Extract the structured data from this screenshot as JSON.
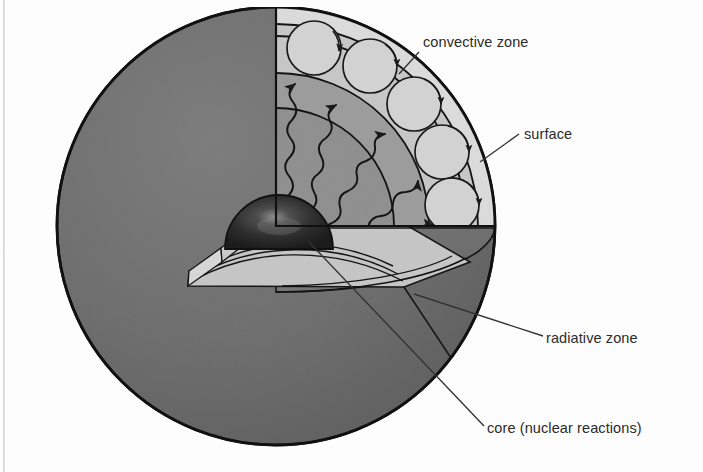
{
  "canvas": {
    "width": 703,
    "height": 472,
    "background": "#fdfdfd"
  },
  "figure": {
    "title_cut_off": "second. The structure of the Sun is",
    "geometry": {
      "sphere_center_x": 276,
      "sphere_center_y": 226,
      "sphere_radius": 219,
      "cut_wedge_angle_deg": 90
    }
  },
  "colors": {
    "outer_sphere": "#6e6e6e",
    "outer_sphere_shadow": "#5f5f5f",
    "surface_band": "#d8d8d8",
    "convective_zone": "#c9c9c9",
    "radiative_zone": "#9a9a9a",
    "radiative_zone_inner": "#8b8b8b",
    "core": "#2a2a2a",
    "core_highlight": "#7a7a7a",
    "floor_light": "#cfcfcf",
    "floor_dark": "#767676",
    "outline": "#1a1a1a",
    "label_text": "#2b2b2b",
    "leader_line": "#3a3a3a",
    "page_background": "#fdfdfd"
  },
  "labels": [
    {
      "id": "convective-zone",
      "text": "convective zone",
      "x": 423,
      "y": 47,
      "anchor": "start",
      "leader": {
        "x1": 419,
        "y1": 52,
        "x2": 399,
        "y2": 74
      }
    },
    {
      "id": "surface",
      "text": "surface",
      "x": 524,
      "y": 139,
      "anchor": "start",
      "leader": {
        "x1": 519,
        "y1": 134,
        "x2": 480,
        "y2": 162
      }
    },
    {
      "id": "radiative-zone",
      "text": "radiative zone",
      "x": 546,
      "y": 343,
      "anchor": "start",
      "leader": {
        "x1": 543,
        "y1": 336,
        "x2": 414,
        "y2": 294
      }
    },
    {
      "id": "core-nuclear-reactions",
      "text": "core (nuclear reactions)",
      "x": 487,
      "y": 433,
      "anchor": "start",
      "leader": {
        "x1": 484,
        "y1": 426,
        "x2": 308,
        "y2": 241
      }
    }
  ],
  "layers": [
    {
      "name": "surface",
      "outer_fraction": 1.0,
      "inner_fraction": 0.925,
      "fill": "#d8d8d8"
    },
    {
      "name": "convective zone",
      "outer_fraction": 0.925,
      "inner_fraction": 0.7,
      "fill": "#c9c9c9"
    },
    {
      "name": "radiative zone",
      "outer_fraction": 0.7,
      "inner_fraction": 0.215,
      "fill": "#9a9a9a"
    },
    {
      "name": "core",
      "outer_fraction": 0.215,
      "inner_fraction": 0.0,
      "fill": "#2a2a2a"
    }
  ],
  "convection_cells": {
    "count": 6,
    "description": "circulation cells drawn as circles with arrowheads inside the convective zone",
    "cells": [
      {
        "cx": 314,
        "cy": 47,
        "r": 27
      },
      {
        "cx": 369,
        "cy": 65,
        "r": 27
      },
      {
        "cx": 414,
        "cy": 102,
        "r": 27
      },
      {
        "cx": 444,
        "cy": 150,
        "r": 27
      },
      {
        "cx": 457,
        "cy": 200,
        "r": 27
      }
    ]
  },
  "radiation_rays": {
    "count": 6,
    "description": "wavy photon paths with arrowheads travelling outward through the radiative zone"
  },
  "floor_arcs": {
    "count": 4,
    "description": "elliptical layer boundaries drawn on the flat cut floor of the wedge"
  }
}
